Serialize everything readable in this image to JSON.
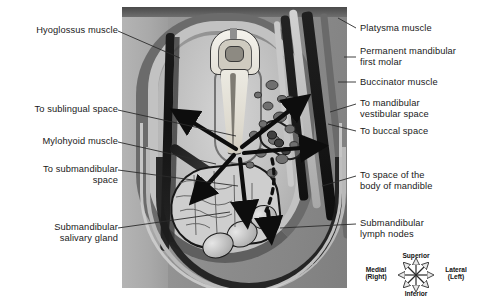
{
  "labels_left": [
    {
      "text": "Hyoglossus muscle",
      "name": "label-hyoglossus-muscle"
    },
    {
      "text": "To sublingual space",
      "name": "label-to-sublingual-space"
    },
    {
      "text": "Mylohyoid muscle",
      "name": "label-mylohyoid-muscle"
    },
    {
      "text": "To submandibular\nspace",
      "name": "label-to-submandibular-space"
    },
    {
      "text": "Submandibular\nsalivary gland",
      "name": "label-submandibular-salivary-gland"
    }
  ],
  "labels_right": [
    {
      "text": "Platysma muscle",
      "name": "label-platysma-muscle"
    },
    {
      "text": "Permanent mandibular\nfirst molar",
      "name": "label-permanent-mandibular-first-molar"
    },
    {
      "text": "Buccinator muscle",
      "name": "label-buccinator-muscle"
    },
    {
      "text": "To mandibular\nvestibular space",
      "name": "label-to-mandibular-vestibular-space"
    },
    {
      "text": "To buccal space",
      "name": "label-to-buccal-space"
    },
    {
      "text": "To space of the\nbody of mandible",
      "name": "label-to-space-of-body-of-mandible"
    },
    {
      "text": "Submandibular\nlymph nodes",
      "name": "label-submandibular-lymph-nodes"
    }
  ],
  "compass": {
    "superior": "Superior",
    "inferior": "Inferior",
    "medial": "Medial\n(Right)",
    "lateral": "Lateral\n(Left)"
  },
  "colors": {
    "background": "#ffffff",
    "photo_base": "#8f8f8f",
    "text": "#1a1a1a",
    "leader_line": "#2b2b2b",
    "arrow": "#0d0d0d"
  }
}
